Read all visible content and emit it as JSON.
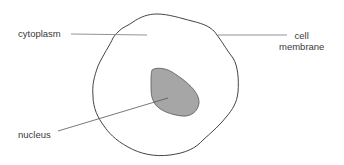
{
  "diagram": {
    "labels": {
      "cytoplasm": "cytoplasm",
      "cell_membrane_line1": "cell",
      "cell_membrane_line2": "membrane",
      "nucleus": "nucleus"
    },
    "colors": {
      "outline": "#444444",
      "nucleus_fill": "#a6a6a6",
      "leader_line": "#666666",
      "text": "#3a3a3a"
    }
  }
}
